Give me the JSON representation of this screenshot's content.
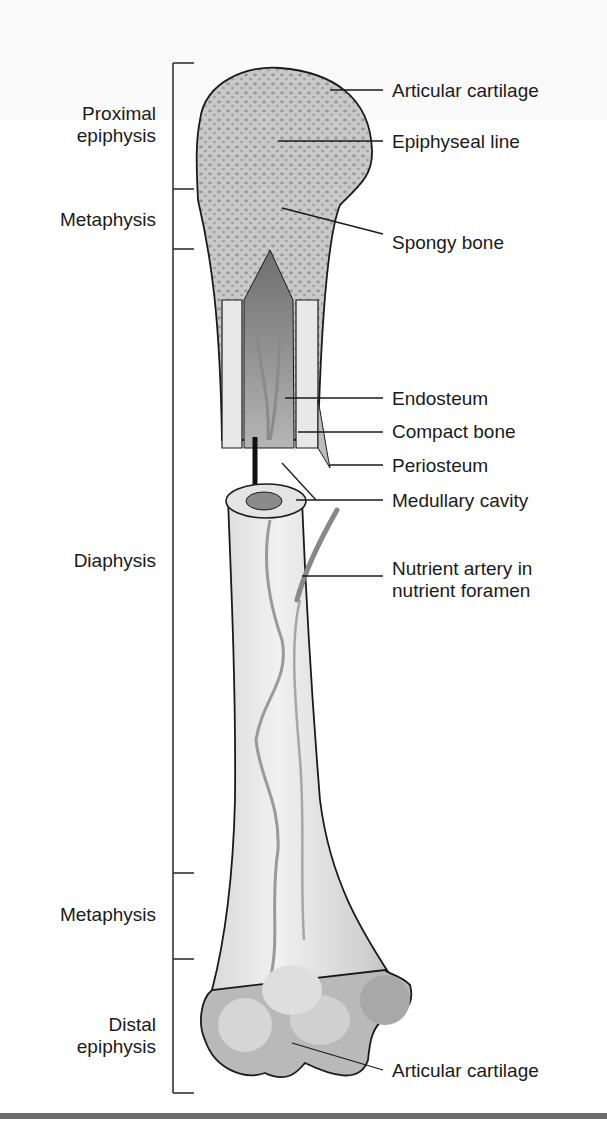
{
  "figure": {
    "regions": [
      {
        "id": "proximal-epiphysis",
        "lines": [
          "Proximal",
          "epiphysis"
        ]
      },
      {
        "id": "metaphysis-proximal",
        "lines": [
          "Metaphysis"
        ]
      },
      {
        "id": "diaphysis",
        "lines": [
          "Diaphysis"
        ]
      },
      {
        "id": "metaphysis-distal",
        "lines": [
          "Metaphysis"
        ]
      },
      {
        "id": "distal-epiphysis",
        "lines": [
          "Distal",
          "epiphysis"
        ]
      }
    ],
    "labels": {
      "articular_cartilage_top": "Articular cartilage",
      "epiphyseal_line": "Epiphyseal line",
      "spongy_bone": "Spongy bone",
      "endosteum": "Endosteum",
      "compact_bone": "Compact bone",
      "periosteum": "Periosteum",
      "medullary_cavity": "Medullary cavity",
      "nutrient_artery_1": "Nutrient artery in",
      "nutrient_artery_2": "nutrient foramen",
      "articular_cartilage_bottom": "Articular cartilage"
    },
    "colors": {
      "bone_light": "#e6e6e6",
      "bone_mid": "#c8c8c8",
      "spongy": "#a9a9a9",
      "cavity": "#7d7d7d",
      "vessel": "#8a8a8a",
      "outline": "#1a1a1a",
      "rule": "#6b6b6b"
    }
  }
}
